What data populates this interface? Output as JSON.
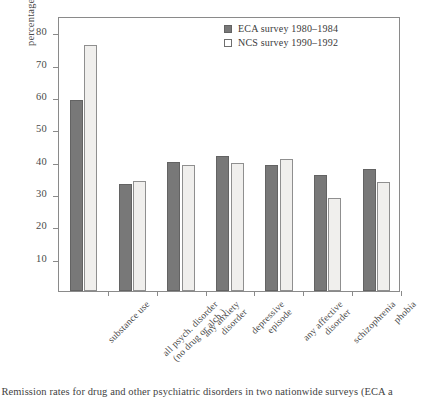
{
  "figure": {
    "caption": "e Remission rates for drug and other psychiatric disorders in two nationwide surveys (ECA a"
  },
  "legend": {
    "position": "top-right",
    "entries": [
      {
        "label": "ECA  survey 1980–1984",
        "swatch": "filled-gray-square",
        "color": "#787878"
      },
      {
        "label": "NCS survey 1990–1992",
        "swatch": "open-white-square",
        "color": "#ffffff"
      }
    ]
  },
  "axes": {
    "ylabel": "percentage of cases remitted",
    "yticks": [
      "10",
      "20",
      "30",
      "40",
      "50",
      "60",
      "70",
      "80"
    ],
    "ymin": 0,
    "ymax": 85
  },
  "chart_data": {
    "type": "bar",
    "title": "",
    "xlabel": "",
    "ylabel": "percentage of cases remitted",
    "ylim": [
      0,
      85
    ],
    "grid": false,
    "legend_position": "upper right",
    "categories": [
      "substance use",
      "all psych. disorder (no drug or alch.)",
      "any anxiety disorder",
      "depressive episode",
      "any affective disorder",
      "schizophrenia",
      "phobia"
    ],
    "category_lines": [
      [
        "substance use",
        ""
      ],
      [
        "all psych. disorder",
        "(no drug or alch.)"
      ],
      [
        "any anxiety",
        "disorder"
      ],
      [
        "depressive",
        "episode"
      ],
      [
        "any affective",
        "disorder"
      ],
      [
        "schizophrenia",
        ""
      ],
      [
        "phobia",
        ""
      ]
    ],
    "series": [
      {
        "name": "ECA  survey 1980–1984",
        "color": "#787878",
        "values": [
          59,
          33,
          39.8,
          41.8,
          38.8,
          35.8,
          37.6
        ]
      },
      {
        "name": "NCS survey 1990–1992",
        "color": "#f0efed",
        "values": [
          76,
          34,
          38.8,
          39.7,
          40.7,
          28.8,
          33.7
        ]
      }
    ]
  }
}
